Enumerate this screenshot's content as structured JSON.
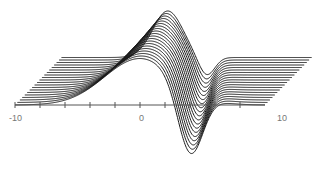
{
  "chart_data": {
    "type": "line",
    "subtype": "waterfall-3d-stacked",
    "title": "",
    "xlabel": "",
    "ylabel": "",
    "xlim": [
      -10,
      10
    ],
    "x_ticks": [
      -10,
      -8,
      -6,
      -4,
      -2,
      0,
      2,
      4,
      6,
      8
    ],
    "x_tick_labels": [
      {
        "value": -10,
        "label": "-10"
      },
      {
        "value": 0,
        "label": "0"
      },
      {
        "value": 10,
        "label": "10"
      }
    ],
    "grid": false,
    "legend": null,
    "num_series": 20,
    "series_offset_per_layer": {
      "dx_px": 2.45,
      "dy_px": -2.5
    },
    "series_shape": {
      "front": {
        "baseline": 0,
        "hump_center": 0.0,
        "hump_height": 0.75,
        "hump_width": 4.0,
        "dip_center": 4.0,
        "dip_depth": -1.05,
        "dip_width": 1.4
      },
      "back": {
        "baseline": 0,
        "hump_center": -1.5,
        "hump_height": 0.75,
        "hump_width": 1.7,
        "dip_center": 1.6,
        "dip_depth": -0.3,
        "dip_width": 0.9
      }
    }
  },
  "axis": {
    "labels": {
      "left": "-10",
      "middle": "0",
      "right": "10"
    },
    "line_color": "#555555"
  },
  "colors": {
    "curve": "#1a1a1a",
    "axis": "#555555",
    "label": "#777777",
    "background": "#ffffff"
  }
}
